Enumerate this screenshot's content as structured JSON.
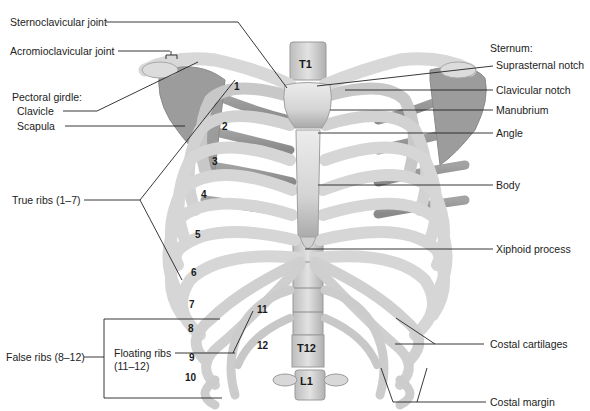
{
  "figure": {
    "colors": {
      "bone": "#d9d9d9",
      "bone_shadow": "#9a9a9a",
      "bone_dark": "#7a7a7a",
      "leader_line": "#222222",
      "text": "#222222"
    }
  },
  "labels_left": {
    "sternoclavicular_joint": "Sternoclavicular joint",
    "acromioclavicular_joint": "Acromioclavicular joint",
    "pectoral_girdle": "Pectoral girdle:",
    "clavicle": "Clavicle",
    "scapula": "Scapula",
    "true_ribs": "True ribs (1–7)",
    "false_ribs": "False ribs (8–12)",
    "floating_ribs_line1": "Floating ribs",
    "floating_ribs_line2": "(11–12)"
  },
  "labels_right": {
    "sternum": "Sternum:",
    "suprasternal_notch": "Suprasternal notch",
    "clavicular_notch": "Clavicular notch",
    "manubrium": "Manubrium",
    "angle": "Angle",
    "body": "Body",
    "xiphoid_process": "Xiphoid process",
    "costal_cartilages": "Costal cartilages",
    "costal_margin": "Costal margin"
  },
  "rib_numbers": [
    "1",
    "2",
    "3",
    "4",
    "5",
    "6",
    "7",
    "8",
    "9",
    "10",
    "11",
    "12"
  ],
  "vertebrae": {
    "t1": "T1",
    "t12": "T12",
    "l1": "L1"
  }
}
